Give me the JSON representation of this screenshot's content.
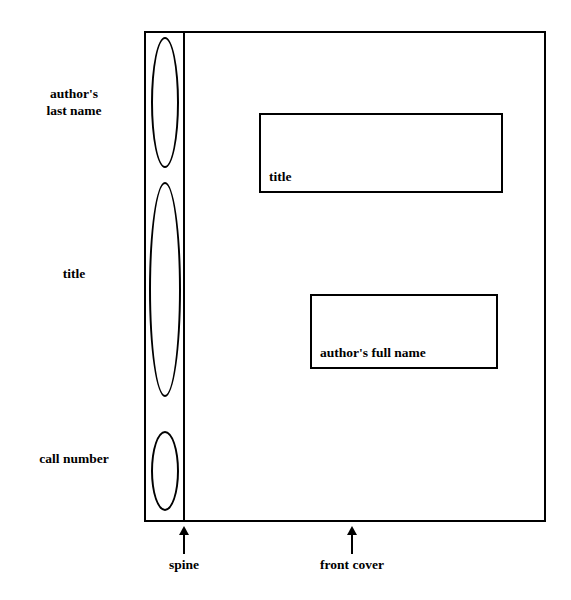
{
  "diagram": {
    "type": "book-anatomy-labeling",
    "book": {
      "spine": {
        "caption": "spine",
        "segments": [
          {
            "id": "author-last-name",
            "label": "author's\nlast name",
            "shape": "ellipse"
          },
          {
            "id": "title",
            "label": "title",
            "shape": "ellipse"
          },
          {
            "id": "call-number",
            "label": "call number",
            "shape": "ellipse"
          }
        ]
      },
      "front_cover": {
        "caption": "front cover",
        "boxes": [
          {
            "id": "title-box",
            "label": "title"
          },
          {
            "id": "author-full-name-box",
            "label": "author's full name"
          }
        ]
      }
    },
    "colors": {
      "stroke": "#000000",
      "fill": "#ffffff",
      "text": "#000000"
    }
  }
}
